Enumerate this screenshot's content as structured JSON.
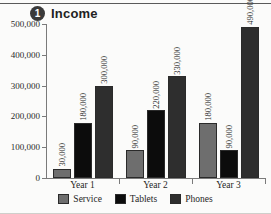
{
  "title": {
    "badge": "1",
    "text": "Income"
  },
  "chart_data": {
    "type": "bar",
    "title": "Income",
    "xlabel": "",
    "ylabel": "",
    "ylim": [
      0,
      500000
    ],
    "ytick_labels": [
      "0",
      "100,000",
      "200,000",
      "300,000",
      "400,000",
      "500,000"
    ],
    "ytick_values": [
      0,
      100000,
      200000,
      300000,
      400000,
      500000
    ],
    "grid": false,
    "legend_position": "bottom",
    "categories": [
      "Year 1",
      "Year 2",
      "Year 3"
    ],
    "series": [
      {
        "name": "Service",
        "color": "#6e6e6e",
        "values": [
          30000,
          90000,
          180000
        ],
        "labels": [
          "30,000",
          "90,000",
          "180,000"
        ]
      },
      {
        "name": "Tablets",
        "color": "#0c0c0c",
        "values": [
          180000,
          220000,
          90000
        ],
        "labels": [
          "180,000",
          "220,000",
          "90,000"
        ]
      },
      {
        "name": "Phones",
        "color": "#2e2e2e",
        "values": [
          300000,
          330000,
          490000
        ],
        "labels": [
          "300,000",
          "330,000",
          "490,000"
        ]
      }
    ]
  }
}
